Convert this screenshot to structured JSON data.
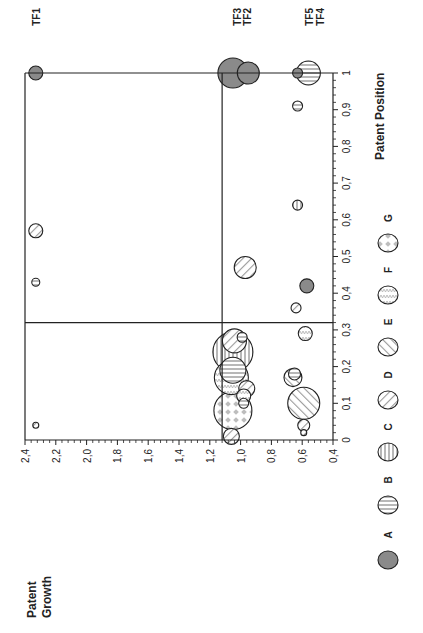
{
  "chart_data": {
    "type": "scatter",
    "subtype": "bubble",
    "orientation": "rotated-90-ccw",
    "title": "",
    "xlabel": "Patent Position",
    "ylabel": "Patent Growth",
    "xlim": [
      0,
      1
    ],
    "ylim": [
      0.4,
      2.4
    ],
    "x_ticks": [
      "0",
      "0,1",
      "0,2",
      "0,3",
      "0,4",
      "0,5",
      "0,6",
      "0,7",
      "0,8",
      "0,9",
      "1"
    ],
    "y_ticks": [
      "0,4",
      "0,6",
      "0,8",
      "1,0",
      "1,2",
      "1,4",
      "1,6",
      "1,8",
      "2,0",
      "2,2",
      "2,4"
    ],
    "grid": false,
    "quadrant_lines": {
      "x": 0.32,
      "y": 1.12
    },
    "legend_position": "bottom",
    "legend": [
      {
        "key": "A",
        "pattern": "solid-gray"
      },
      {
        "key": "B",
        "pattern": "horizontal-lines"
      },
      {
        "key": "C",
        "pattern": "vertical-lines"
      },
      {
        "key": "D",
        "pattern": "diagonal-down"
      },
      {
        "key": "E",
        "pattern": "diagonal-up"
      },
      {
        "key": "F",
        "pattern": "zigzag"
      },
      {
        "key": "G",
        "pattern": "diamond-checker"
      }
    ],
    "annotations": [
      {
        "label": "TF1",
        "x": 1.0,
        "y": 2.33
      },
      {
        "label": "TF2",
        "x": 1.0,
        "y": 0.95
      },
      {
        "label": "TF3",
        "x": 1.0,
        "y": 1.05
      },
      {
        "label": "TF4",
        "x": 1.0,
        "y": 0.56
      },
      {
        "label": "TF5",
        "x": 1.0,
        "y": 0.63
      }
    ],
    "points": [
      {
        "series": "A",
        "x": 1.0,
        "y": 2.33,
        "r": 7
      },
      {
        "series": "A",
        "x": 1.0,
        "y": 0.95,
        "r": 11
      },
      {
        "series": "A",
        "x": 1.0,
        "y": 1.05,
        "r": 15
      },
      {
        "series": "B",
        "x": 1.0,
        "y": 0.56,
        "r": 12
      },
      {
        "series": "A",
        "x": 1.0,
        "y": 0.63,
        "r": 5
      },
      {
        "series": "B",
        "x": 0.91,
        "y": 0.63,
        "r": 5
      },
      {
        "series": "C",
        "x": 0.64,
        "y": 0.63,
        "r": 5
      },
      {
        "series": "D",
        "x": 0.57,
        "y": 2.33,
        "r": 7
      },
      {
        "series": "D",
        "x": 0.47,
        "y": 0.97,
        "r": 11
      },
      {
        "series": "B",
        "x": 0.43,
        "y": 2.33,
        "r": 4
      },
      {
        "series": "A",
        "x": 0.42,
        "y": 0.57,
        "r": 7
      },
      {
        "series": "D",
        "x": 0.36,
        "y": 0.64,
        "r": 5
      },
      {
        "series": "F",
        "x": 0.29,
        "y": 0.58,
        "r": 7
      },
      {
        "series": "B",
        "x": 0.28,
        "y": 0.99,
        "r": 5
      },
      {
        "series": "D",
        "x": 0.27,
        "y": 1.04,
        "r": 12
      },
      {
        "series": "C",
        "x": 0.24,
        "y": 1.05,
        "r": 20
      },
      {
        "series": "B",
        "x": 0.19,
        "y": 1.05,
        "r": 13
      },
      {
        "series": "F",
        "x": 0.17,
        "y": 1.06,
        "r": 17
      },
      {
        "series": "E",
        "x": 0.17,
        "y": 0.66,
        "r": 9
      },
      {
        "series": "B",
        "x": 0.18,
        "y": 0.65,
        "r": 6
      },
      {
        "series": "D",
        "x": 0.14,
        "y": 0.96,
        "r": 8
      },
      {
        "series": "F",
        "x": 0.12,
        "y": 0.98,
        "r": 7
      },
      {
        "series": "B",
        "x": 0.1,
        "y": 0.98,
        "r": 5
      },
      {
        "series": "G",
        "x": 0.08,
        "y": 1.05,
        "r": 19
      },
      {
        "series": "E",
        "x": 0.1,
        "y": 0.59,
        "r": 16
      },
      {
        "series": "D",
        "x": 0.04,
        "y": 2.33,
        "r": 3
      },
      {
        "series": "D",
        "x": 0.04,
        "y": 0.59,
        "r": 6
      },
      {
        "series": "D",
        "x": 0.02,
        "y": 0.59,
        "r": 3
      },
      {
        "series": "D",
        "x": 0.01,
        "y": 1.06,
        "r": 8
      }
    ]
  },
  "labels": {
    "ylabel_line1": "Patent",
    "ylabel_line2": "Growth",
    "xlabel": "Patent Position"
  },
  "colors": {
    "axis": "#222222",
    "fill_A": "#8a8a8a",
    "hatch": "#9a9a9a"
  }
}
